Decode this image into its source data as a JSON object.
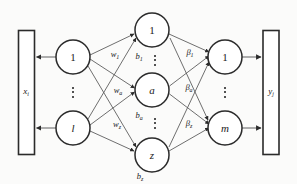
{
  "diagram": {
    "background_color": "#fbfbfa",
    "stroke_color": "#2b2b2b",
    "input_box": {
      "label_main": "x",
      "label_sub": "i"
    },
    "output_box": {
      "label_main": "y",
      "label_sub": "j"
    },
    "input_layer": {
      "top_node": "1",
      "bottom_node": "l",
      "ellipsis": "⋮"
    },
    "hidden_layer": {
      "top_node": "1",
      "middle_node": "a",
      "bottom_node": "z",
      "ellipsis": "⋮"
    },
    "output_layer": {
      "top_node": "1",
      "bottom_node": "m",
      "ellipsis": "⋮"
    },
    "weights": [
      {
        "main": "w",
        "sub": "1"
      },
      {
        "main": "w",
        "sub": "a"
      },
      {
        "main": "w",
        "sub": "z"
      }
    ],
    "biases": [
      {
        "main": "b",
        "sub": "1"
      },
      {
        "main": "b",
        "sub": "a"
      },
      {
        "main": "b",
        "sub": "z"
      }
    ],
    "betas": [
      {
        "main": "β",
        "sub": "1"
      },
      {
        "main": "β",
        "sub": "a"
      },
      {
        "main": "β",
        "sub": "z"
      }
    ]
  }
}
